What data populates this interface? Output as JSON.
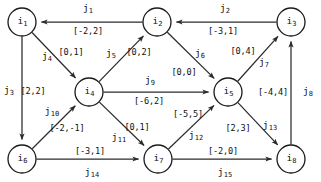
{
  "figure": {
    "width": 321,
    "height": 182,
    "stroke_color": "#2b2b2b",
    "node_fill": "#ffffff",
    "text_color": "#111111"
  },
  "nodes": [
    {
      "id": "i1",
      "label": "i",
      "sub": "1",
      "cx": 22,
      "cy": 22,
      "r": 14
    },
    {
      "id": "i2",
      "label": "i",
      "sub": "2",
      "cx": 157,
      "cy": 22,
      "r": 14
    },
    {
      "id": "i3",
      "label": "i",
      "sub": "3",
      "cx": 291,
      "cy": 22,
      "r": 14
    },
    {
      "id": "i4",
      "label": "i",
      "sub": "4",
      "cx": 89,
      "cy": 92,
      "r": 14
    },
    {
      "id": "i5",
      "label": "i",
      "sub": "5",
      "cx": 228,
      "cy": 92,
      "r": 14
    },
    {
      "id": "i6",
      "label": "i",
      "sub": "6",
      "cx": 22,
      "cy": 159,
      "r": 14
    },
    {
      "id": "i7",
      "label": "i",
      "sub": "7",
      "cx": 158,
      "cy": 159,
      "r": 14
    },
    {
      "id": "i8",
      "label": "i",
      "sub": "8",
      "cx": 291,
      "cy": 159,
      "r": 14
    }
  ],
  "edges": [
    {
      "id": "j1",
      "label": "j",
      "sub": "1",
      "from": "i2",
      "to": "i1",
      "interval": "[-2,2]",
      "lower": -2,
      "upper": 2,
      "name_x": 88,
      "name_y": 9,
      "int_x": 88,
      "int_y": 31
    },
    {
      "id": "j2",
      "label": "j",
      "sub": "2",
      "from": "i3",
      "to": "i2",
      "interval": "[-3,1]",
      "lower": -3,
      "upper": 1,
      "name_x": 225,
      "name_y": 9,
      "int_x": 223,
      "int_y": 31
    },
    {
      "id": "j3",
      "label": "j",
      "sub": "3",
      "from": "i1",
      "to": "i6",
      "interval": "[2,2]",
      "lower": 2,
      "upper": 2,
      "name_x": 9,
      "name_y": 91,
      "int_x": 33,
      "int_y": 91
    },
    {
      "id": "j4",
      "label": "j",
      "sub": "4",
      "from": "i1",
      "to": "i4",
      "interval": "[0,1]",
      "lower": 0,
      "upper": 1,
      "name_x": 47,
      "name_y": 57,
      "int_x": 71,
      "int_y": 52
    },
    {
      "id": "j5",
      "label": "j",
      "sub": "5",
      "from": "i4",
      "to": "i2",
      "interval": "[0,2]",
      "lower": 0,
      "upper": 2,
      "name_x": 111,
      "name_y": 54,
      "int_x": 139,
      "int_y": 52
    },
    {
      "id": "j6",
      "label": "j",
      "sub": "6",
      "from": "i2",
      "to": "i5",
      "interval": "[0,0]",
      "lower": 0,
      "upper": 0,
      "name_x": 200,
      "name_y": 54,
      "int_x": 184,
      "int_y": 72
    },
    {
      "id": "j7",
      "label": "j",
      "sub": "7",
      "from": "i5",
      "to": "i3",
      "interval": "[0,4]",
      "lower": 0,
      "upper": 4,
      "name_x": 264,
      "name_y": 63,
      "int_x": 243,
      "int_y": 51
    },
    {
      "id": "j8",
      "label": "j",
      "sub": "8",
      "from": "i8",
      "to": "i3",
      "interval": "[-4,4]",
      "lower": -4,
      "upper": 4,
      "name_x": 308,
      "name_y": 92,
      "int_x": 273,
      "int_y": 92
    },
    {
      "id": "j9",
      "label": "j",
      "sub": "9",
      "from": "i4",
      "to": "i5",
      "interval": "[-6,2]",
      "lower": -6,
      "upper": 2,
      "name_x": 150,
      "name_y": 81,
      "int_x": 149,
      "int_y": 101
    },
    {
      "id": "j10",
      "label": "j",
      "sub": "10",
      "from": "i6",
      "to": "i4",
      "interval": "[-2,-1]",
      "lower": -2,
      "upper": -1,
      "name_x": 52,
      "name_y": 112,
      "int_x": 67,
      "int_y": 128
    },
    {
      "id": "j11",
      "label": "j",
      "sub": "11",
      "from": "i4",
      "to": "i7",
      "interval": "[0,1]",
      "lower": 0,
      "upper": 1,
      "name_x": 119,
      "name_y": 138,
      "int_x": 137,
      "int_y": 127
    },
    {
      "id": "j12",
      "label": "j",
      "sub": "12",
      "from": "i7",
      "to": "i5",
      "interval": "[-5,5]",
      "lower": -5,
      "upper": 5,
      "name_x": 196,
      "name_y": 136,
      "int_x": 188,
      "int_y": 114
    },
    {
      "id": "j13",
      "label": "j",
      "sub": "13",
      "from": "i5",
      "to": "i8",
      "interval": "[2,3]",
      "lower": 2,
      "upper": 3,
      "name_x": 270,
      "name_y": 126,
      "int_x": 238,
      "int_y": 128
    },
    {
      "id": "j14",
      "label": "j",
      "sub": "14",
      "from": "i6",
      "to": "i7",
      "interval": "[-3,1]",
      "lower": -3,
      "upper": 1,
      "name_x": 92,
      "name_y": 173,
      "int_x": 90,
      "int_y": 151
    },
    {
      "id": "j15",
      "label": "j",
      "sub": "15",
      "from": "i7",
      "to": "i8",
      "interval": "[-2,0]",
      "lower": -2,
      "upper": 0,
      "name_x": 225,
      "name_y": 173,
      "int_x": 223,
      "int_y": 151
    }
  ]
}
